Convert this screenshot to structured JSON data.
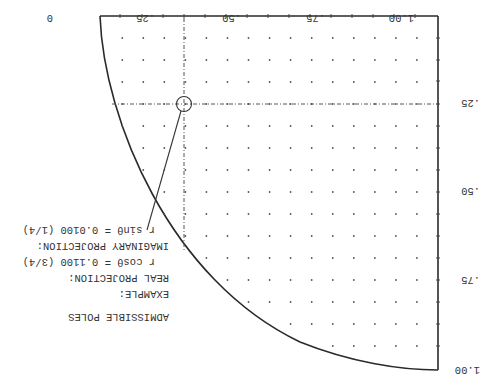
{
  "figure": {
    "orientation": "rotated 180 degrees",
    "title": "ADMISSIBLE POLES",
    "x_axis_ticks": [
      "0",
      ".25",
      ".50",
      ".75",
      "1.00"
    ],
    "y_axis_ticks": [
      "0",
      ".25",
      ".50",
      ".75",
      "1.00"
    ],
    "example": {
      "heading": "EXAMPLE:",
      "real_label": "REAL PROJECTION:",
      "real_formula": "r cosθ = 0.1100  (3/4)",
      "imag_label": "IMAGINARY PROJECTION:",
      "imag_formula": "r sinθ = 0.0100  (1/4)"
    },
    "highlighted_point": {
      "real": 0.75,
      "imag": 0.25
    },
    "colors": {
      "line": "#2a2a2a",
      "dots": "#555555",
      "text": "#333333"
    }
  }
}
